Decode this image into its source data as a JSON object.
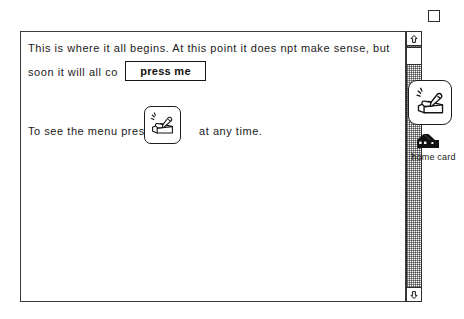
{
  "window": {
    "zoom_box_name": "zoom-box"
  },
  "card": {
    "line_1": "This is where it all begins.   At this point it does npt make sense, but",
    "line_2": "soon it will all co",
    "line_3_before": "To see the menu press",
    "line_3_after": "at any time.",
    "press_me_button_label": "press me",
    "menu_icon_name": "hand-pressing-card-icon"
  },
  "scrollbar": {
    "up_arrow_glyph": "↑",
    "down_arrow_glyph": "↓"
  },
  "palette": {
    "icon_name": "hand-pressing-card-icon",
    "home_icon_name": "house-icon",
    "home_card_label": "home card"
  },
  "colors": {
    "ink": "#1a1a1a",
    "border": "#2f2f2f",
    "paper": "#ffffff",
    "track_gray": "#8d8d8d"
  }
}
